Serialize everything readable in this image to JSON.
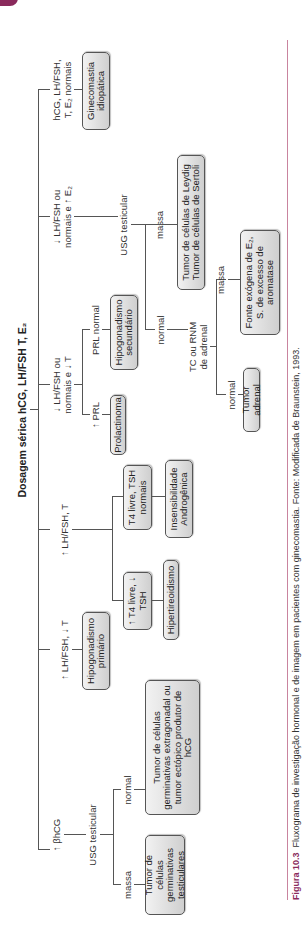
{
  "page": {
    "accent_color": "#8a2a5c",
    "box_fill": "#dcdcdc"
  },
  "flowchart": {
    "title": "Dosagem sérica hCG, LH/FSH T, E₂",
    "branches": [
      {
        "condition": "↑ βhCG",
        "step": "USG testicular",
        "outcomes": [
          {
            "condition": "massa",
            "result": "Tumor de células germinativas testiculares"
          },
          {
            "condition": "normal",
            "result": "Tumor de células germinativas extragonadal ou tumor ectópico produtor de hCG"
          }
        ]
      },
      {
        "condition": "↑ LH/FSH, ↓ T",
        "result": "Hipogonadismo primário"
      },
      {
        "condition": "↑ LH/FSH, T",
        "outcomes": [
          {
            "condition": "↑ T4 livre, ↓ TSH",
            "result": "Hipertireoidismo"
          },
          {
            "condition": "T4 livre, TSH normais",
            "result": "Insensibilidade Androgênica"
          }
        ]
      },
      {
        "condition": "↓ LH/FSH ou normais e ↓ T",
        "outcomes": [
          {
            "condition": "↑ PRL",
            "result": "Prolactinoma"
          },
          {
            "condition": "PRL normal",
            "result": "Hipogonadismo secundário"
          }
        ]
      },
      {
        "condition": "↓ LH/FSH ou normais e ↑ E₂",
        "step": "USG testicular",
        "outcomes": [
          {
            "condition": "massa",
            "result": "Tumor de células de Leydig Tumor de células de Sertoli"
          },
          {
            "condition": "normal",
            "step": "TC ou RNM de adrenal",
            "outcomes": [
              {
                "condition": "normal",
                "result": "Tumor adrenal"
              },
              {
                "condition": "massa",
                "result": "Fonte exógena de E₂, S. de excesso de aromatase"
              }
            ]
          }
        ]
      },
      {
        "condition": "hCG, LH/FSH, T, E₂ normais",
        "result": "Ginecomastia idiopática"
      }
    ]
  },
  "labels": {
    "b1_cond": "↑ βhCG",
    "b1_step": "USG testicular",
    "b1_massa": "massa",
    "b1_normal": "normal",
    "b1_res_massa": "Tumor de células germinativas testiculares",
    "b1_res_normal": "Tumor de células germinativas extragonadal ou tumor ectópico produtor de hCG",
    "b2_cond": "↑ LH/FSH, ↓ T",
    "b2_res": "Hipogonadismo primário",
    "b3_cond": "↑ LH/FSH, T",
    "b3_sub1": "↑ T4 livre, ↓ TSH",
    "b3_res1": "Hipertireoidismo",
    "b3_sub2": "T4 livre, TSH normais",
    "b3_res2": "Insensibilidade Androgênica",
    "b4_cond_l1": "↓ LH/FSH ou",
    "b4_cond_l2": "normais e ↓ T",
    "b4_prl_up": "↑ PRL",
    "b4_prl_res": "Prolactinoma",
    "b4_prl_norm": "PRL normal",
    "b4_prl_norm_res": "Hipogonadismo secundário",
    "b5_cond_l1": "↓ LH/FSH ou",
    "b5_cond_l2": "normais e ↑ E₂",
    "b5_step": "USG testicular",
    "b5_massa": "massa",
    "b5_res_massa": "Tumor de células de Leydig Tumor de células de Sertoli",
    "b5_normal": "normal",
    "b5_step2_l1": "TC ou RNM",
    "b5_step2_l2": "de adrenal",
    "b5_adr_normal": "normal",
    "b5_adr_normal_res": "Tumor adrenal",
    "b5_adr_massa": "massa",
    "b5_adr_massa_res": "Fonte exógena de E₂, S. de excesso de aromatase",
    "b6_cond_l1": "hCG, LH/FSH,",
    "b6_cond_l2": "T, E₂ normais",
    "b6_res": "Ginecomastia idiopática"
  },
  "caption": {
    "figure_label": "Figura 10.3",
    "text": "Fluxograma de investigação hormonal e de imagem em pacientes com ginecomastia. Fonte: Modificada de Braunstein, 1993."
  }
}
